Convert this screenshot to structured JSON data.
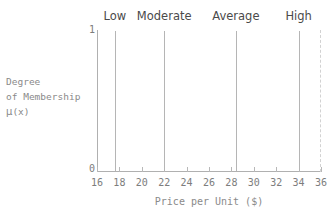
{
  "chart_data": {
    "type": "bar",
    "title": "",
    "xlabel": "Price per Unit ($)",
    "ylabel_lines": [
      "Degree",
      "of Membership",
      "μ(x)"
    ],
    "xlim": [
      16,
      36
    ],
    "ylim": [
      0,
      1
    ],
    "grid": false,
    "legend": "none",
    "xticks": [
      16,
      18,
      20,
      22,
      24,
      26,
      28,
      30,
      32,
      34,
      36
    ],
    "xtick_labels": [
      "16",
      "18",
      "20",
      "22",
      "24",
      "26",
      "28",
      "30",
      "32",
      "34",
      "36"
    ],
    "yticks": [
      0,
      1
    ],
    "ytick_labels": [
      "0",
      "1"
    ],
    "series": [
      {
        "name": "Membership singletons",
        "x": [
          17.6,
          22.0,
          28.4,
          34.0
        ],
        "values": [
          1,
          1,
          1,
          1
        ],
        "labels": [
          "Low",
          "Moderate",
          "Average",
          "High"
        ]
      }
    ],
    "annotations": [
      {
        "text": "Low",
        "x": 17.6,
        "y": 1
      },
      {
        "text": "Moderate",
        "x": 22.0,
        "y": 1
      },
      {
        "text": "Average",
        "x": 28.4,
        "y": 1
      },
      {
        "text": "High",
        "x": 34.0,
        "y": 1
      }
    ]
  },
  "colors": {
    "line": "#b5b5b5",
    "axis": "#b0b0b0",
    "tick_text": "#7d7d7d",
    "category_text": "#4a4a4a",
    "axis_title_text": "#8a8a8a",
    "dashed_border": "#d2d2d2",
    "background": "#ffffff"
  },
  "ylabel": {
    "line1": "Degree",
    "line2": "of Membership",
    "mu": "μ",
    "mu_arg": "(x)"
  },
  "ytick_top": "1",
  "ytick_bottom": "0"
}
